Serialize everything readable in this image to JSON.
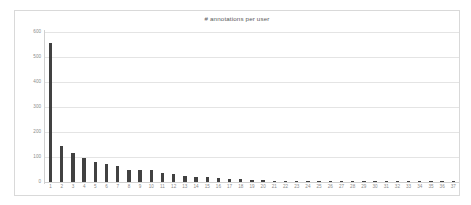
{
  "chart_data": {
    "type": "bar",
    "title": "# annotations per user",
    "xlabel": "",
    "ylabel": "",
    "ylim": [
      0,
      600
    ],
    "yticks": [
      0,
      100,
      200,
      300,
      400,
      500,
      600
    ],
    "ytick_labels": [
      "0",
      "100",
      "200",
      "300",
      "400",
      "500",
      "600"
    ],
    "grid": true,
    "legend": false,
    "bar_color": "#414141",
    "gridline_color": "#e4e4e4",
    "plot_background": "#ffffff",
    "frame_color": "#d9d9d9",
    "tick_label_color": "#8c8c8c",
    "title_color": "#595959",
    "categories": [
      "1",
      "2",
      "3",
      "4",
      "5",
      "6",
      "7",
      "8",
      "9",
      "10",
      "11",
      "12",
      "13",
      "14",
      "15",
      "16",
      "17",
      "18",
      "19",
      "20",
      "21",
      "22",
      "23",
      "24",
      "25",
      "26",
      "27",
      "28",
      "29",
      "30",
      "31",
      "32",
      "33",
      "34",
      "35",
      "36",
      "37"
    ],
    "values": [
      555,
      145,
      115,
      97,
      82,
      73,
      65,
      48,
      48,
      47,
      38,
      34,
      26,
      21,
      20,
      16,
      13,
      12,
      8,
      7,
      4,
      3,
      3,
      2,
      2,
      2,
      2,
      1,
      1,
      1,
      1,
      1,
      1,
      1,
      1,
      1,
      1
    ]
  }
}
